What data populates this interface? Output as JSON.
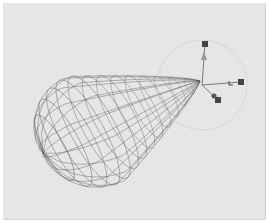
{
  "viewport": {
    "background": "#e6e6e6",
    "object": {
      "type": "wireframe-mesh",
      "shape": "teardrop",
      "wire_color": "#555555",
      "center": [
        100,
        120
      ],
      "rings": 14,
      "meridians": 16
    },
    "gizmo": {
      "origin": [
        199,
        82
      ],
      "color": "#7a7a7a",
      "handle_color": "#444444",
      "rotation_circle_radius": 45,
      "handles": [
        {
          "axis": "y",
          "pos": [
            202,
            41
          ]
        },
        {
          "axis": "x",
          "pos": [
            238,
            79
          ]
        },
        {
          "axis": "z",
          "pos": [
            215,
            97
          ]
        }
      ]
    }
  }
}
